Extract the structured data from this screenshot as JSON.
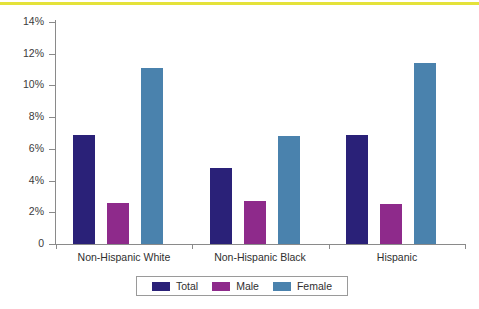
{
  "chart_data": {
    "type": "bar",
    "title": "",
    "subtitle": "",
    "xlabel": "",
    "ylabel": "",
    "categories": [
      "Non-Hispanic White",
      "Non-Hispanic Black",
      "Hispanic"
    ],
    "series": [
      {
        "name": "Total",
        "color": "#2a2178",
        "values": [
          6.9,
          4.8,
          6.9
        ]
      },
      {
        "name": "Male",
        "color": "#8e2a8b",
        "values": [
          2.6,
          2.7,
          2.5
        ]
      },
      {
        "name": "Female",
        "color": "#4a82ad",
        "values": [
          11.1,
          6.8,
          11.4
        ]
      }
    ],
    "ylim": [
      0,
      14
    ],
    "yticks": [
      0,
      2,
      4,
      6,
      8,
      10,
      12,
      14
    ],
    "ytick_labels": [
      "0",
      "2%",
      "4%",
      "6%",
      "8%",
      "10%",
      "12%",
      "14%"
    ],
    "grid": false,
    "legend_position": "bottom",
    "units": "percent"
  },
  "accent": {
    "top_rule_color": "#e4e23a",
    "axis_color": "#8a8a8a",
    "text_color": "#2f2f2f"
  }
}
